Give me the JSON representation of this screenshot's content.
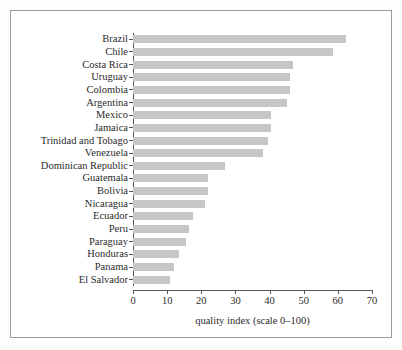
{
  "chart_data": {
    "type": "bar",
    "orientation": "horizontal",
    "title": "",
    "subtitle": "",
    "xlabel": "quality index (scale 0–100)",
    "ylabel": "",
    "xlim": [
      0,
      70
    ],
    "xticks": [
      0,
      10,
      20,
      30,
      40,
      50,
      60,
      70
    ],
    "xticklabels": [
      "0",
      "10",
      "20",
      "30",
      "40",
      "50",
      "60",
      "70"
    ],
    "grid": false,
    "legend": null,
    "bar_color": "#c6c6c6",
    "axis_color": "#555555",
    "frame_color": "#9a9a9a",
    "categories": [
      "Brazil",
      "Chile",
      "Costa Rica",
      "Uruguay",
      "Colombia",
      "Argentina",
      "Mexico",
      "Jamaica",
      "Trinidad and Tobago",
      "Venezuela",
      "Dominican Republic",
      "Guatemala",
      "Bolivia",
      "Nicaragua",
      "Ecuador",
      "Peru",
      "Paraguay",
      "Honduras",
      "Panama",
      "El Salvador"
    ],
    "values": [
      62.5,
      58.5,
      47,
      46,
      46,
      45,
      40.5,
      40.5,
      39.5,
      38,
      27,
      22,
      22,
      21,
      17.5,
      16.5,
      15.5,
      13.5,
      12,
      10.8
    ]
  }
}
